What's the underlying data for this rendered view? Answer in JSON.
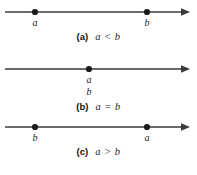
{
  "figure": {
    "line_color": "#3a3a3a",
    "point_color": "#1a1a1a",
    "background": "#ffffff",
    "axis": {
      "start_x": 5,
      "end_x": 189,
      "arrow_direction": "right"
    }
  },
  "panels": [
    {
      "tag": "(a)",
      "relation": "a < b",
      "points": [
        {
          "label": "a",
          "x": 35,
          "label_position": "below"
        },
        {
          "label": "b",
          "x": 147,
          "label_position": "below"
        }
      ]
    },
    {
      "tag": "(b)",
      "relation": "a = b",
      "points": [
        {
          "label": "a",
          "x": 89,
          "label_position": "below"
        },
        {
          "label": "b",
          "x": 89,
          "label_position": "below-stacked"
        }
      ]
    },
    {
      "tag": "(c)",
      "relation": "a > b",
      "points": [
        {
          "label": "b",
          "x": 35,
          "label_position": "below"
        },
        {
          "label": "a",
          "x": 147,
          "label_position": "below"
        }
      ]
    }
  ]
}
